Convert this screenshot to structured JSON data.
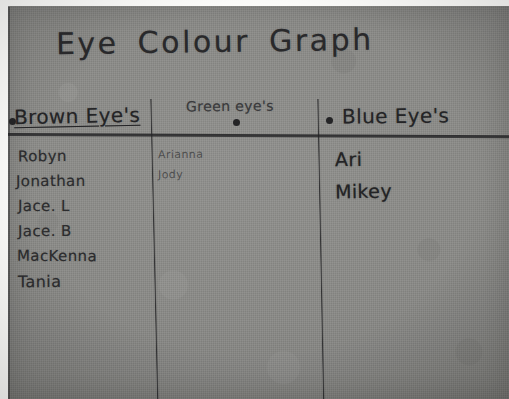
{
  "photo": {
    "title": "Eye Colour Graph",
    "medium": "handwritten pencil on grey construction paper",
    "paper_color": "#8a8a87",
    "ink_color": "#2b2b2d"
  },
  "chart_data": {
    "type": "table",
    "title": "Eye Colour Graph",
    "xlabel": "",
    "ylabel": "",
    "categories": [
      "Brown Eye's",
      "Green eye's",
      "Blue Eye's"
    ],
    "values": [
      6,
      2,
      2
    ],
    "columns": [
      {
        "header": "Brown Eye's",
        "bullet": "•",
        "count": 6,
        "names": [
          "Robyn",
          "Jonathan",
          "Jace. L",
          "Jace. B",
          "MacKenna",
          "Tania"
        ]
      },
      {
        "header": "Green eye's",
        "bullet": "•",
        "count": 2,
        "names": [
          "Arianna",
          "Jody"
        ]
      },
      {
        "header": "Blue Eye's",
        "bullet": "•",
        "count": 2,
        "names": [
          "Ari",
          "Mikey"
        ]
      }
    ]
  }
}
